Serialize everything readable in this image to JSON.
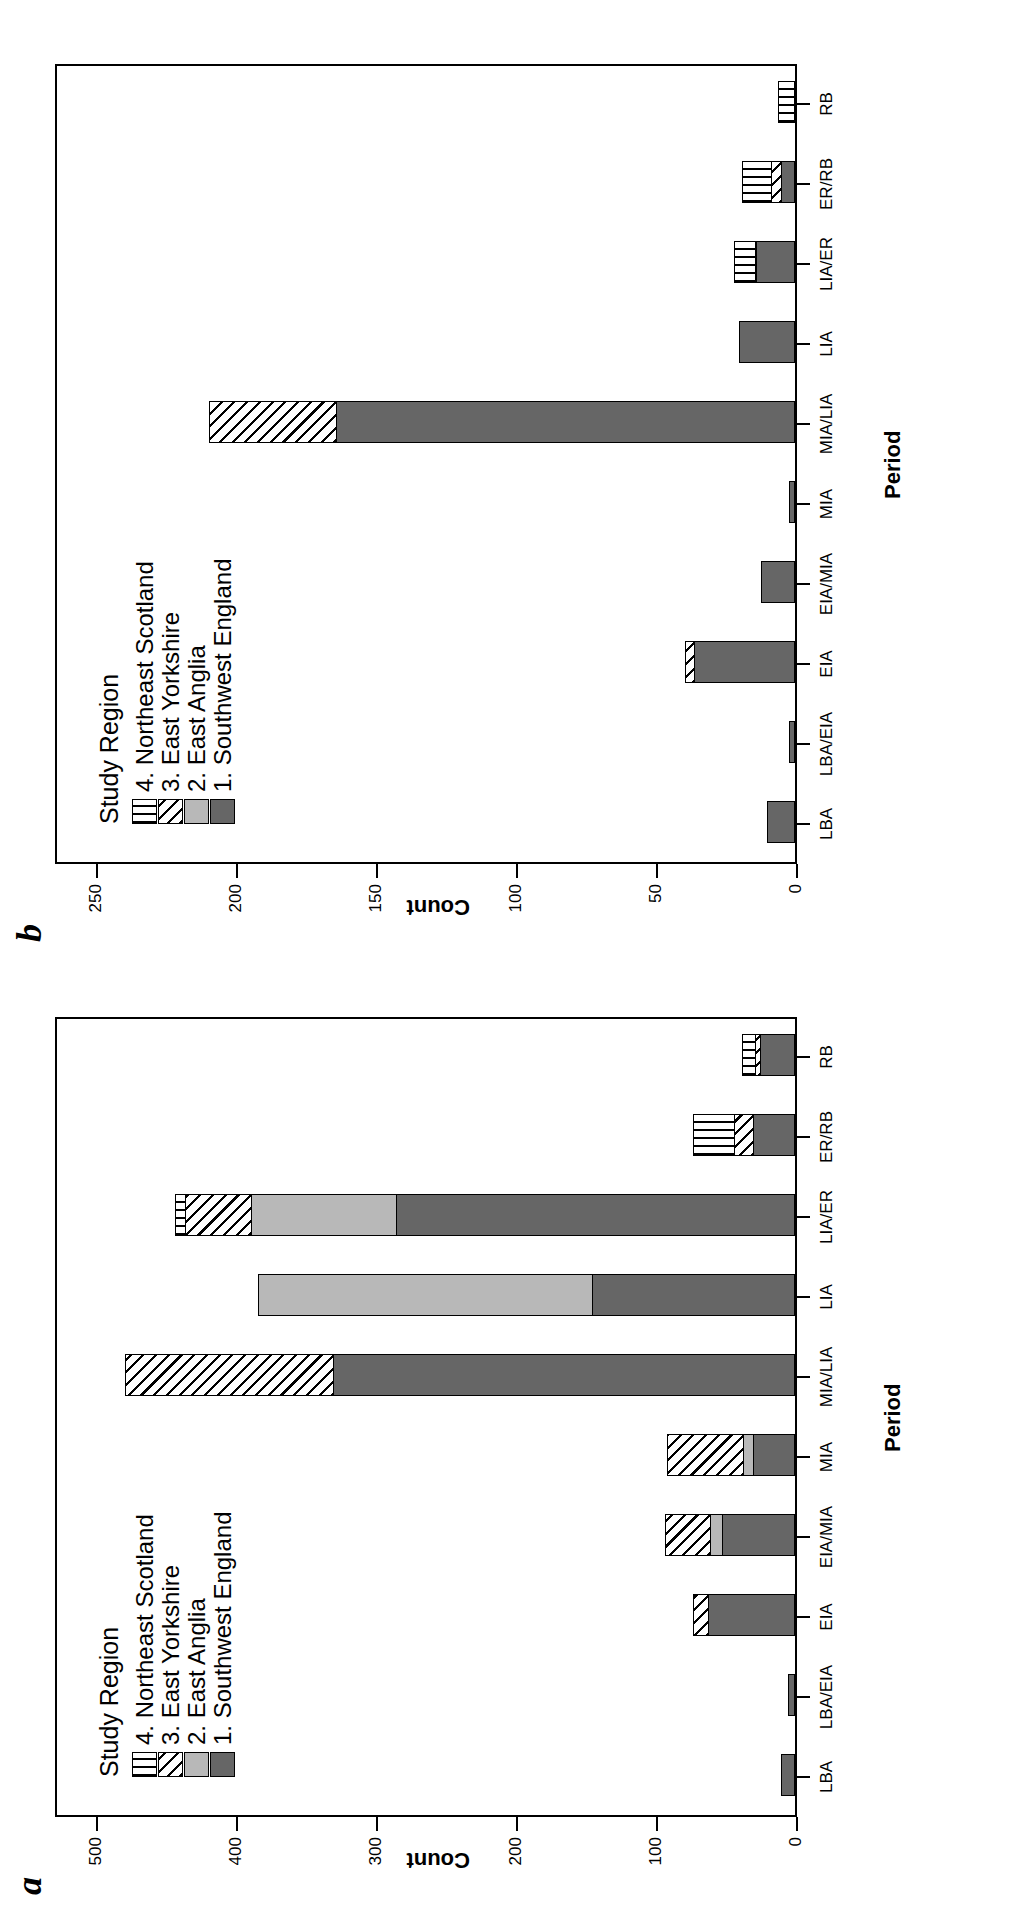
{
  "figure": {
    "orientation": "rotated-90-ccw",
    "panels": [
      "a",
      "b"
    ]
  },
  "legend": {
    "title": "Study Region",
    "items": [
      {
        "key": "4",
        "label": "4. Northeast Scotland",
        "pattern": "vertical-stripes"
      },
      {
        "key": "3",
        "label": "3. East Yorkshire",
        "pattern": "diagonal-hatch"
      },
      {
        "key": "2",
        "label": "2. East Anglia",
        "pattern": "light-grey"
      },
      {
        "key": "1",
        "label": "1. Southwest England",
        "pattern": "dark-grey"
      }
    ]
  },
  "chart_data": [
    {
      "panel": "a",
      "type": "bar",
      "stacked": true,
      "title": "",
      "xlabel": "Period",
      "ylabel": "Count",
      "ylim": [
        0,
        530
      ],
      "yticks": [
        0,
        100,
        200,
        300,
        400,
        500
      ],
      "grid": false,
      "legend_position": "top-left",
      "categories": [
        "LBA",
        "LBA/EIA",
        "EIA",
        "EIA/MIA",
        "MIA",
        "MIA/LIA",
        "LIA",
        "LIA/ER",
        "ER/RB",
        "RB"
      ],
      "series": [
        {
          "name": "1. Southwest England",
          "values": [
            10,
            5,
            62,
            52,
            30,
            330,
            145,
            285,
            30,
            25
          ]
        },
        {
          "name": "2. East Anglia",
          "values": [
            0,
            0,
            0,
            10,
            8,
            0,
            240,
            105,
            0,
            0
          ]
        },
        {
          "name": "3. East Yorkshire",
          "values": [
            0,
            0,
            12,
            33,
            56,
            150,
            0,
            48,
            15,
            5
          ]
        },
        {
          "name": "4. Northeast Scotland",
          "values": [
            0,
            0,
            0,
            0,
            0,
            0,
            0,
            8,
            30,
            10
          ]
        }
      ]
    },
    {
      "panel": "b",
      "type": "bar",
      "stacked": true,
      "title": "",
      "xlabel": "Period",
      "ylabel": "Count",
      "ylim": [
        0,
        265
      ],
      "yticks": [
        0,
        50,
        100,
        150,
        200,
        250
      ],
      "grid": false,
      "legend_position": "top-left",
      "categories": [
        "LBA",
        "LBA/EIA",
        "EIA",
        "EIA/MIA",
        "MIA",
        "MIA/LIA",
        "LIA",
        "LIA/ER",
        "ER/RB",
        "RB"
      ],
      "series": [
        {
          "name": "1. Southwest England",
          "values": [
            10,
            2,
            36,
            12,
            2,
            164,
            20,
            14,
            5,
            0
          ]
        },
        {
          "name": "2. East Anglia",
          "values": [
            0,
            0,
            0,
            0,
            0,
            0,
            0,
            0,
            0,
            0
          ]
        },
        {
          "name": "3. East Yorkshire",
          "values": [
            0,
            0,
            4,
            0,
            0,
            46,
            0,
            1,
            4,
            0
          ]
        },
        {
          "name": "4. Northeast Scotland",
          "values": [
            0,
            0,
            0,
            0,
            0,
            0,
            0,
            8,
            11,
            6
          ]
        }
      ]
    }
  ]
}
